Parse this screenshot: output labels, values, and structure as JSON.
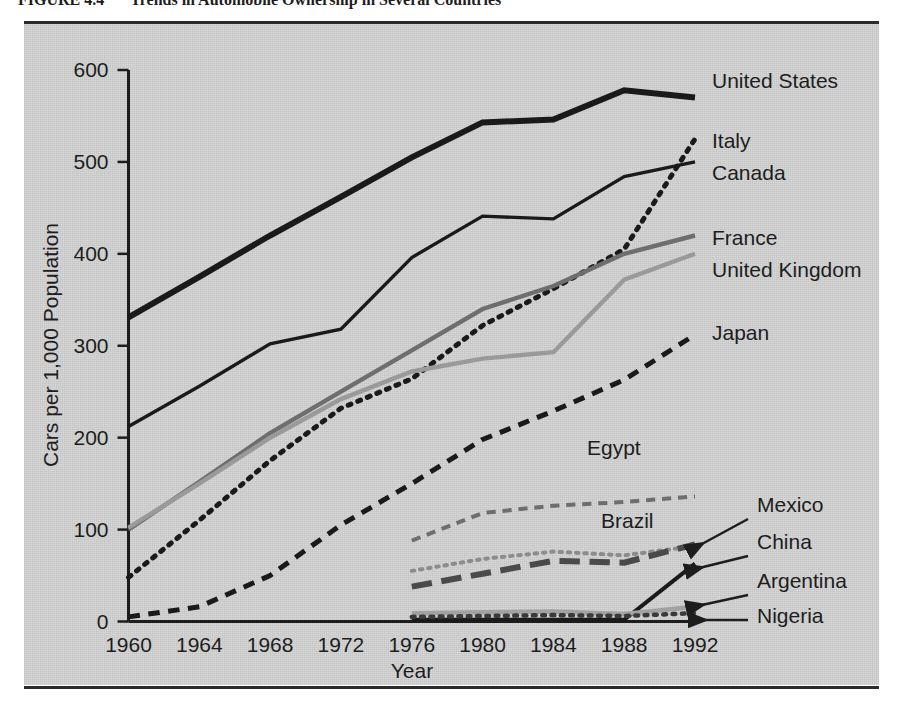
{
  "figure": {
    "caption_label": "FIGURE 4.4",
    "caption_title": "Trends in Automobile Ownership in Several Countries"
  },
  "chart_data": {
    "type": "line",
    "title": "Trends in Automobile Ownership in Several Countries",
    "xlabel": "Year",
    "ylabel": "Cars per 1,000 Population",
    "x": [
      1960,
      1964,
      1968,
      1972,
      1976,
      1980,
      1984,
      1988,
      1992
    ],
    "xticklabels": [
      "1960",
      "1964",
      "1968",
      "1972",
      "1976",
      "1980",
      "1984",
      "1988",
      "1992"
    ],
    "yticklabels": [
      "0",
      "100",
      "200",
      "300",
      "400",
      "500",
      "600"
    ],
    "yticks": [
      0,
      100,
      200,
      300,
      400,
      500,
      600
    ],
    "xlim": [
      1960,
      1992
    ],
    "ylim": [
      0,
      600
    ],
    "grid": false,
    "legend_position": "right-inline-labels",
    "series": [
      {
        "name": "United States",
        "label": "United States",
        "style": "solid",
        "color": "#1a1a1a",
        "width": 6,
        "x": [
          1960,
          1964,
          1968,
          1972,
          1976,
          1980,
          1984,
          1988,
          1992
        ],
        "values": [
          331,
          375,
          420,
          462,
          505,
          543,
          546,
          578,
          570
        ]
      },
      {
        "name": "Italy",
        "label": "Italy",
        "style": "dotted",
        "color": "#1a1a1a",
        "width": 5,
        "x": [
          1960,
          1964,
          1968,
          1972,
          1976,
          1980,
          1984,
          1988,
          1992
        ],
        "values": [
          48,
          110,
          175,
          232,
          264,
          322,
          362,
          405,
          525
        ]
      },
      {
        "name": "Canada",
        "label": "Canada",
        "style": "solid",
        "color": "#1a1a1a",
        "width": 3.4,
        "x": [
          1960,
          1964,
          1968,
          1972,
          1976,
          1980,
          1984,
          1988,
          1992
        ],
        "values": [
          212,
          256,
          302,
          318,
          396,
          441,
          438,
          484,
          500
        ]
      },
      {
        "name": "France",
        "label": "France",
        "style": "solid",
        "color": "#6e6e6e",
        "width": 4.4,
        "x": [
          1960,
          1964,
          1968,
          1972,
          1976,
          1980,
          1984,
          1988,
          1992
        ],
        "values": [
          100,
          152,
          205,
          250,
          295,
          340,
          365,
          400,
          420
        ]
      },
      {
        "name": "United Kingdom",
        "label": "United Kingdom",
        "style": "solid",
        "color": "#9a9a9a",
        "width": 4.4,
        "x": [
          1960,
          1964,
          1968,
          1972,
          1976,
          1980,
          1984,
          1988,
          1992
        ],
        "values": [
          102,
          150,
          200,
          242,
          272,
          286,
          293,
          372,
          400
        ]
      },
      {
        "name": "Japan",
        "label": "Japan",
        "style": "dashed",
        "color": "#1a1a1a",
        "width": 5,
        "x": [
          1960,
          1964,
          1968,
          1972,
          1976,
          1980,
          1984,
          1988,
          1992
        ],
        "values": [
          5,
          16,
          50,
          105,
          150,
          198,
          229,
          263,
          312
        ]
      },
      {
        "name": "Egypt",
        "label": "Egypt",
        "style": "dashed",
        "color": "#6e6e6e",
        "width": 4,
        "x": [
          1976,
          1980,
          1984,
          1988,
          1992
        ],
        "values": [
          88,
          118,
          126,
          130,
          136
        ]
      },
      {
        "name": "Brazil",
        "label": "Brazil",
        "style": "dotted",
        "color": "#8c8c8c",
        "width": 4,
        "x": [
          1976,
          1980,
          1984,
          1988,
          1992
        ],
        "values": [
          55,
          68,
          76,
          72,
          82
        ]
      },
      {
        "name": "Mexico",
        "label": "Mexico",
        "style": "longdash",
        "color": "#4a4a4a",
        "width": 6,
        "x": [
          1976,
          1980,
          1984,
          1988,
          1992
        ],
        "values": [
          38,
          52,
          66,
          64,
          84
        ]
      },
      {
        "name": "China",
        "label": "China",
        "style": "solid",
        "color": "#1a1a1a",
        "width": 4,
        "x": [
          1976,
          1980,
          1984,
          1988,
          1992
        ],
        "values": [
          2,
          2,
          2,
          2,
          63
        ]
      },
      {
        "name": "Argentina",
        "label": "Argentina",
        "style": "solid",
        "color": "#a2a2a2",
        "width": 4.5,
        "x": [
          1976,
          1980,
          1984,
          1988,
          1992
        ],
        "values": [
          9,
          10,
          11,
          8,
          16
        ]
      },
      {
        "name": "Nigeria",
        "label": "Nigeria",
        "style": "dotted",
        "color": "#3a3a3a",
        "width": 4.5,
        "x": [
          1976,
          1980,
          1984,
          1988,
          1992
        ],
        "values": [
          5,
          6,
          7,
          6,
          9
        ]
      }
    ],
    "annotations": [
      {
        "text": "Egypt",
        "kind": "inline"
      },
      {
        "text": "Brazil",
        "kind": "inline"
      },
      {
        "text": "Mexico",
        "kind": "arrow"
      },
      {
        "text": "China",
        "kind": "arrow"
      },
      {
        "text": "Argentina",
        "kind": "arrow"
      },
      {
        "text": "Nigeria",
        "kind": "arrow"
      }
    ]
  }
}
